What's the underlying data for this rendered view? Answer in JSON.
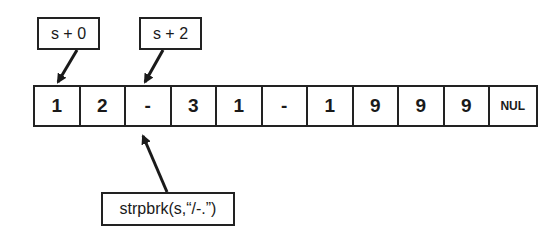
{
  "pointers": [
    {
      "label": "s + 0",
      "target_index": 0
    },
    {
      "label": "s + 2",
      "target_index": 2
    }
  ],
  "cells": [
    "1",
    "2",
    "-",
    "3",
    "1",
    "-",
    "1",
    "9",
    "9",
    "9",
    "NUL"
  ],
  "call": {
    "label": "strpbrk(s,“/-.”)",
    "target_index": 2
  }
}
